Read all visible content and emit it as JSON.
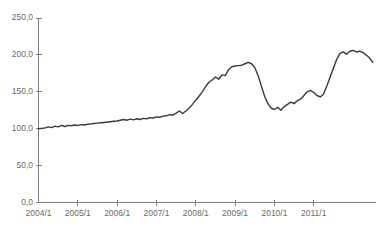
{
  "chart_data": {
    "type": "line",
    "title": "",
    "subtitle": "",
    "xlabel": "",
    "ylabel": "",
    "grid": false,
    "legend": "none",
    "xlim": [
      "2004/1",
      "2011/12"
    ],
    "ylim": [
      0.0,
      250.0
    ],
    "ytick_labels": [
      "250,0",
      "200,0",
      "150,0",
      "100,0",
      "50,0",
      "0,0"
    ],
    "ytick_values": [
      250.0,
      200.0,
      150.0,
      100.0,
      50.0,
      0.0
    ],
    "xtick_labels": [
      "2004/1",
      "2005/1",
      "2006/1",
      "2007/1",
      "2008/1",
      "2009/1",
      "2010/1",
      "2011/1"
    ],
    "xtick_values": [
      0,
      12,
      24,
      36,
      48,
      60,
      72,
      84
    ],
    "line_color": "#3a3a3a",
    "axis_color": "#808080",
    "text_color": "#6b6b6b",
    "x": [
      0,
      1,
      2,
      3,
      4,
      5,
      6,
      7,
      8,
      9,
      10,
      11,
      12,
      13,
      14,
      15,
      16,
      17,
      18,
      19,
      20,
      21,
      22,
      23,
      24,
      25,
      26,
      27,
      28,
      29,
      30,
      31,
      32,
      33,
      34,
      35,
      36,
      37,
      38,
      39,
      40,
      41,
      42,
      43,
      44,
      45,
      46,
      47,
      48,
      49,
      50,
      51,
      52,
      53,
      54,
      55,
      56,
      57,
      58,
      59,
      60,
      61,
      62,
      63,
      64,
      65,
      66,
      67,
      68,
      69,
      70,
      71,
      72,
      73,
      74,
      75,
      76,
      77,
      78,
      79,
      80,
      81,
      82,
      83,
      84,
      85,
      86,
      87,
      88,
      89,
      90,
      91,
      92,
      93,
      94,
      95
    ],
    "values": [
      100.0,
      100.5,
      101.0,
      102.5,
      101.5,
      103.5,
      102.5,
      104.5,
      103.0,
      104.5,
      104.0,
      105.0,
      104.5,
      105.5,
      105.0,
      106.0,
      106.5,
      107.0,
      107.5,
      108.0,
      108.5,
      109.0,
      109.5,
      110.0,
      110.5,
      111.5,
      112.5,
      111.5,
      113.0,
      112.0,
      113.5,
      112.5,
      114.0,
      113.5,
      115.0,
      114.5,
      116.0,
      115.5,
      117.0,
      117.5,
      119.0,
      118.5,
      121.0,
      124.0,
      120.5,
      124.0,
      128.0,
      133.0,
      139.0,
      144.0,
      150.0,
      157.0,
      163.0,
      166.0,
      170.0,
      167.0,
      173.0,
      172.0,
      180.0,
      184.0,
      185.0,
      185.5,
      186.0,
      188.0,
      190.0,
      188.0,
      183.0,
      172.0,
      158.0,
      144.0,
      134.0,
      128.0,
      126.0,
      129.0,
      125.0,
      130.0,
      133.0,
      136.0,
      134.0,
      138.0,
      140.0,
      145.0,
      150.0,
      152.0,
      149.0,
      145.0,
      143.0,
      147.0,
      158.0,
      170.0,
      182.0,
      194.0,
      202.0,
      204.0,
      201.0,
      205.0
    ],
    "values_tail": [
      206.0,
      204.0,
      205.0,
      203.0,
      200.0,
      196.0,
      190.0
    ]
  }
}
